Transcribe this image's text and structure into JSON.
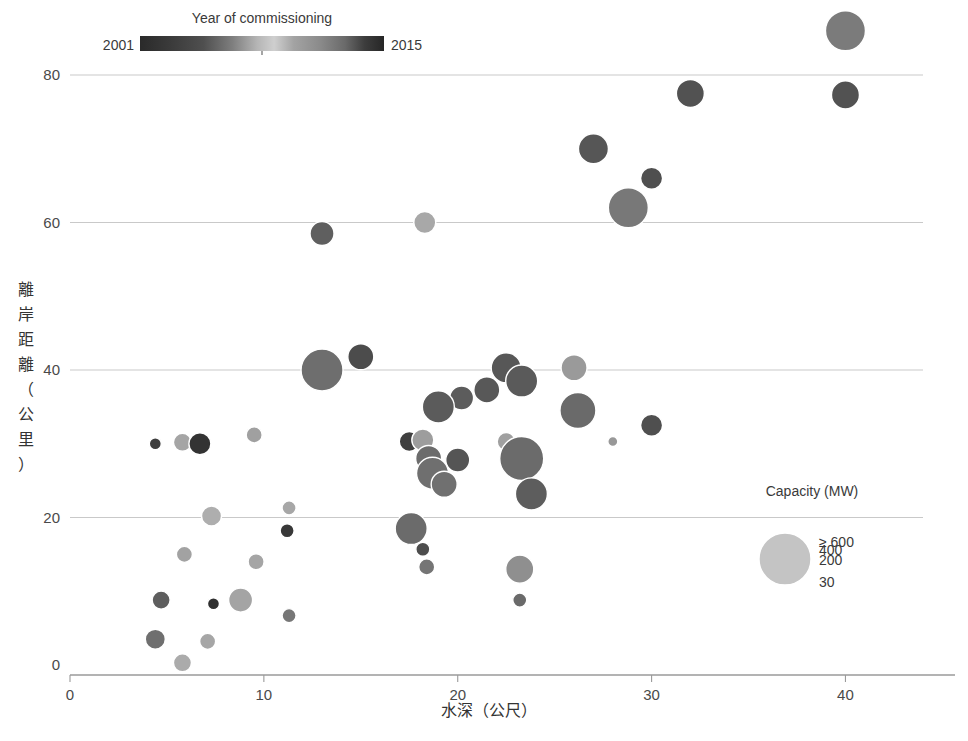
{
  "chart_data": {
    "type": "scatter",
    "title": "",
    "xlabel": "水深（公尺）",
    "ylabel": "離岸距離（公里）",
    "xlim": [
      0,
      44
    ],
    "ylim": [
      0,
      88
    ],
    "xticks": [
      0,
      10,
      20,
      30,
      40
    ],
    "yticks": [
      0,
      20,
      40,
      60,
      80
    ],
    "xticklabels": [
      "0",
      "10",
      "20",
      "30",
      "40"
    ],
    "yticklabels": [
      "0",
      "20",
      "40",
      "60",
      "80"
    ],
    "grid": "horizontal",
    "size_encoding": "Capacity (MW)",
    "color_encoding": "Year of commissioning",
    "points": [
      {
        "x": 40.0,
        "y": 86.0,
        "capacity": 600,
        "year": 2009,
        "color": "#7b7b7b",
        "r": 20
      },
      {
        "x": 32.0,
        "y": 77.5,
        "capacity": 310,
        "year": 2013,
        "color": "#525252",
        "r": 14
      },
      {
        "x": 40.0,
        "y": 77.3,
        "capacity": 300,
        "year": 2013,
        "color": "#525252",
        "r": 14
      },
      {
        "x": 27.0,
        "y": 70.0,
        "capacity": 350,
        "year": 2013,
        "color": "#565656",
        "r": 15
      },
      {
        "x": 30.0,
        "y": 66.0,
        "capacity": 200,
        "year": 2013,
        "color": "#4f4f4f",
        "r": 11
      },
      {
        "x": 28.8,
        "y": 62.0,
        "capacity": 600,
        "year": 2009,
        "color": "#787878",
        "r": 20
      },
      {
        "x": 13.0,
        "y": 58.5,
        "capacity": 220,
        "year": 2012,
        "color": "#5f5f5f",
        "r": 12
      },
      {
        "x": 18.3,
        "y": 60.0,
        "capacity": 200,
        "year": 2006,
        "color": "#a8a8a8",
        "r": 11
      },
      {
        "x": 13.0,
        "y": 40.0,
        "capacity": 600,
        "year": 2010,
        "color": "#6e6e6e",
        "r": 21
      },
      {
        "x": 15.0,
        "y": 41.8,
        "capacity": 250,
        "year": 2013,
        "color": "#4c4c4c",
        "r": 13
      },
      {
        "x": 22.5,
        "y": 40.3,
        "capacity": 300,
        "year": 2012,
        "color": "#575757",
        "r": 15
      },
      {
        "x": 23.3,
        "y": 38.5,
        "capacity": 330,
        "year": 2012,
        "color": "#5a5a5a",
        "r": 16
      },
      {
        "x": 26.0,
        "y": 40.3,
        "capacity": 230,
        "year": 2006,
        "color": "#9a9a9a",
        "r": 13
      },
      {
        "x": 21.5,
        "y": 37.3,
        "capacity": 230,
        "year": 2012,
        "color": "#585858",
        "r": 13
      },
      {
        "x": 20.2,
        "y": 36.2,
        "capacity": 210,
        "year": 2012,
        "color": "#5c5c5c",
        "r": 12
      },
      {
        "x": 19.0,
        "y": 35.0,
        "capacity": 300,
        "year": 2012,
        "color": "#5b5b5b",
        "r": 16
      },
      {
        "x": 26.2,
        "y": 34.5,
        "capacity": 400,
        "year": 2011,
        "color": "#6a6a6a",
        "r": 18
      },
      {
        "x": 30.0,
        "y": 32.5,
        "capacity": 200,
        "year": 2013,
        "color": "#4f4f4f",
        "r": 11
      },
      {
        "x": 28.0,
        "y": 30.3,
        "capacity": 30,
        "year": 2008,
        "color": "#989898",
        "r": 5
      },
      {
        "x": 17.5,
        "y": 30.3,
        "capacity": 180,
        "year": 2013,
        "color": "#3f3f3f",
        "r": 10
      },
      {
        "x": 18.2,
        "y": 30.5,
        "capacity": 200,
        "year": 2007,
        "color": "#9d9d9d",
        "r": 11
      },
      {
        "x": 22.5,
        "y": 30.3,
        "capacity": 150,
        "year": 2007,
        "color": "#a0a0a0",
        "r": 9
      },
      {
        "x": 18.5,
        "y": 28.0,
        "capacity": 250,
        "year": 2011,
        "color": "#6c6c6c",
        "r": 13
      },
      {
        "x": 20.0,
        "y": 27.8,
        "capacity": 210,
        "year": 2012,
        "color": "#555555",
        "r": 12
      },
      {
        "x": 23.3,
        "y": 28.0,
        "capacity": 600,
        "year": 2011,
        "color": "#6b6b6b",
        "r": 22
      },
      {
        "x": 18.7,
        "y": 26.0,
        "capacity": 320,
        "year": 2011,
        "color": "#6f6f6f",
        "r": 16
      },
      {
        "x": 19.3,
        "y": 24.5,
        "capacity": 250,
        "year": 2011,
        "color": "#707070",
        "r": 13
      },
      {
        "x": 23.8,
        "y": 23.2,
        "capacity": 320,
        "year": 2012,
        "color": "#5d5d5d",
        "r": 16
      },
      {
        "x": 4.4,
        "y": 30.0,
        "capacity": 60,
        "year": 2013,
        "color": "#3e3e3e",
        "r": 6
      },
      {
        "x": 5.8,
        "y": 30.2,
        "capacity": 150,
        "year": 2006,
        "color": "#a5a5a5",
        "r": 9
      },
      {
        "x": 6.7,
        "y": 30.0,
        "capacity": 180,
        "year": 2014,
        "color": "#333333",
        "r": 11
      },
      {
        "x": 9.5,
        "y": 31.2,
        "capacity": 130,
        "year": 2007,
        "color": "#a0a0a0",
        "r": 8
      },
      {
        "x": 11.3,
        "y": 21.3,
        "capacity": 100,
        "year": 2007,
        "color": "#a7a7a7",
        "r": 7
      },
      {
        "x": 7.3,
        "y": 20.2,
        "capacity": 160,
        "year": 2006,
        "color": "#aeaeae",
        "r": 10
      },
      {
        "x": 11.2,
        "y": 18.2,
        "capacity": 90,
        "year": 2014,
        "color": "#383838",
        "r": 7
      },
      {
        "x": 17.6,
        "y": 18.5,
        "capacity": 300,
        "year": 2011,
        "color": "#6b6b6b",
        "r": 16
      },
      {
        "x": 18.2,
        "y": 15.7,
        "capacity": 80,
        "year": 2013,
        "color": "#4d4d4d",
        "r": 7
      },
      {
        "x": 18.4,
        "y": 13.3,
        "capacity": 90,
        "year": 2011,
        "color": "#757575",
        "r": 8
      },
      {
        "x": 23.2,
        "y": 13.0,
        "capacity": 250,
        "year": 2008,
        "color": "#8f8f8f",
        "r": 14
      },
      {
        "x": 23.2,
        "y": 8.8,
        "capacity": 70,
        "year": 2012,
        "color": "#6a6a6a",
        "r": 7
      },
      {
        "x": 5.9,
        "y": 15.0,
        "capacity": 110,
        "year": 2006,
        "color": "#a2a2a2",
        "r": 8
      },
      {
        "x": 9.6,
        "y": 14.0,
        "capacity": 110,
        "year": 2006,
        "color": "#a5a5a5",
        "r": 8
      },
      {
        "x": 4.7,
        "y": 8.8,
        "capacity": 130,
        "year": 2012,
        "color": "#5e5e5e",
        "r": 9
      },
      {
        "x": 7.4,
        "y": 8.3,
        "capacity": 60,
        "year": 2014,
        "color": "#2f2f2f",
        "r": 6
      },
      {
        "x": 8.8,
        "y": 8.8,
        "capacity": 220,
        "year": 2007,
        "color": "#a4a4a4",
        "r": 12
      },
      {
        "x": 11.3,
        "y": 6.7,
        "capacity": 80,
        "year": 2011,
        "color": "#777777",
        "r": 7
      },
      {
        "x": 4.4,
        "y": 3.5,
        "capacity": 140,
        "year": 2010,
        "color": "#6f6f6f",
        "r": 10
      },
      {
        "x": 7.1,
        "y": 3.2,
        "capacity": 110,
        "year": 2006,
        "color": "#a6a6a6",
        "r": 8
      },
      {
        "x": 5.8,
        "y": 0.3,
        "capacity": 130,
        "year": 2006,
        "color": "#ababab",
        "r": 9
      }
    ]
  },
  "color_legend": {
    "title": "Year of commissioning",
    "min_label": "2001",
    "max_label": "2015",
    "stops": [
      {
        "offset": 0,
        "color": "#2a2a2a"
      },
      {
        "offset": 12,
        "color": "#3a3a3a"
      },
      {
        "offset": 26,
        "color": "#4f4f4f"
      },
      {
        "offset": 38,
        "color": "#7f7f7f"
      },
      {
        "offset": 48,
        "color": "#b5b5b5"
      },
      {
        "offset": 55,
        "color": "#cfcfcf"
      },
      {
        "offset": 63,
        "color": "#a3a3a3"
      },
      {
        "offset": 74,
        "color": "#8a8a8a"
      },
      {
        "offset": 84,
        "color": "#6a6a6a"
      },
      {
        "offset": 92,
        "color": "#3d3d3d"
      },
      {
        "offset": 100,
        "color": "#262626"
      }
    ]
  },
  "size_legend": {
    "title": "Capacity (MW)",
    "items": [
      {
        "label": "30",
        "r": 6
      },
      {
        "label": "200",
        "r": 17
      },
      {
        "label": "400",
        "r": 22
      },
      {
        "label": "≥ 600",
        "r": 26
      }
    ]
  },
  "axes": {
    "x_title": "水深（公尺）",
    "y_title": "離岸距離（公里）"
  }
}
